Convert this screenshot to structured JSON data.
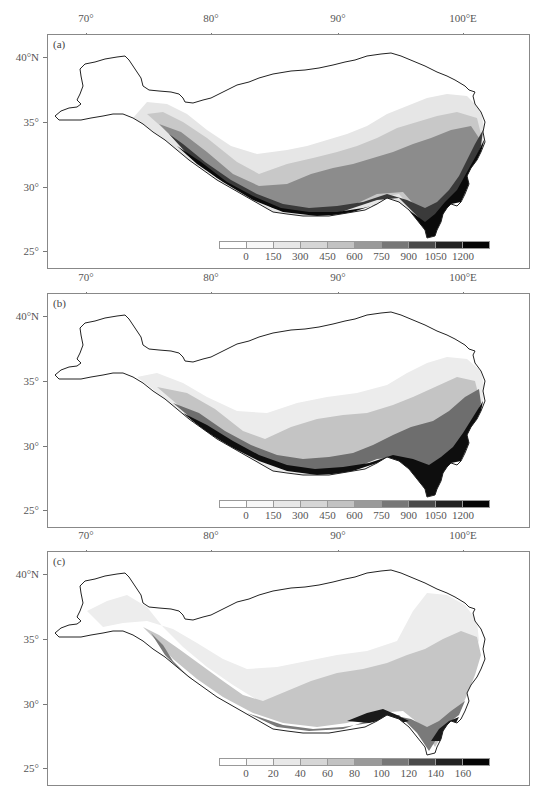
{
  "figure": {
    "x_ticks": [
      {
        "label": "70°",
        "x": 39
      },
      {
        "label": "80°",
        "x": 164
      },
      {
        "label": "90°",
        "x": 291
      },
      {
        "label": "100°E",
        "x": 416
      }
    ],
    "y_ticks": [
      {
        "label": "40°N",
        "y": 23
      },
      {
        "label": "35°",
        "y": 88
      },
      {
        "label": "30°",
        "y": 153
      },
      {
        "label": "25°",
        "y": 217
      }
    ],
    "colorbar_colors": [
      "#ffffff",
      "#f7f7f7",
      "#e8e8e8",
      "#d6d6d6",
      "#c2c2c2",
      "#9a9a9a",
      "#777777",
      "#4a4a4a",
      "#222222",
      "#050505"
    ],
    "panels": [
      {
        "label": "(a)",
        "top": 34,
        "colorbar_labels": [
          "0",
          "150",
          "300",
          "450",
          "600",
          "750",
          "900",
          "1050",
          "1200"
        ]
      },
      {
        "label": "(b)",
        "top": 293,
        "colorbar_labels": [
          "0",
          "150",
          "300",
          "450",
          "600",
          "750",
          "900",
          "1050",
          "1200"
        ]
      },
      {
        "label": "(c)",
        "top": 551,
        "colorbar_labels": [
          "0",
          "20",
          "40",
          "60",
          "80",
          "100",
          "120",
          "140",
          "160"
        ]
      }
    ]
  },
  "chart_data": [
    {
      "type": "heatmap",
      "title": "(a)",
      "region": "Tibetan Plateau",
      "x_ticks": [
        "70°",
        "80°",
        "90°",
        "100°E"
      ],
      "y_ticks": [
        "40°N",
        "35°",
        "30°",
        "25°"
      ],
      "xlim": [
        67,
        104
      ],
      "ylim": [
        23.5,
        42
      ],
      "colorbar": {
        "levels": [
          0,
          150,
          300,
          450,
          600,
          750,
          900,
          1050,
          1200
        ],
        "colormap": "grayscale (white to black)"
      },
      "pattern": "Highest values (>1200) along southern/southeastern margin (Himalayas, SE plateau ~95-103°E, 27-35°N); lowest (<150) over northwestern interior"
    },
    {
      "type": "heatmap",
      "title": "(b)",
      "region": "Tibetan Plateau",
      "x_ticks": [
        "70°",
        "80°",
        "90°",
        "100°E"
      ],
      "y_ticks": [
        "40°N",
        "35°",
        "30°",
        "25°"
      ],
      "xlim": [
        67,
        104
      ],
      "ylim": [
        23.5,
        42
      ],
      "colorbar": {
        "levels": [
          0,
          150,
          300,
          450,
          600,
          750,
          900,
          1050,
          1200
        ],
        "colormap": "grayscale (white to black)"
      },
      "pattern": "Similar to (a); high values along southern rim and southeast, broad low values across west and north"
    },
    {
      "type": "heatmap",
      "title": "(c)",
      "region": "Tibetan Plateau",
      "x_ticks": [
        "70°",
        "80°",
        "90°",
        "100°E"
      ],
      "y_ticks": [
        "40°N",
        "35°",
        "30°",
        "25°"
      ],
      "xlim": [
        67,
        104
      ],
      "ylim": [
        23.5,
        42
      ],
      "colorbar": {
        "levels": [
          0,
          20,
          40,
          60,
          80,
          100,
          120,
          140,
          160
        ],
        "colormap": "grayscale (white to black)"
      },
      "pattern": "Moderate values (40-100) over southeast and western Himalaya; maximum (>140) near southern edge ~92-98°E; low over central/northern interior"
    }
  ]
}
